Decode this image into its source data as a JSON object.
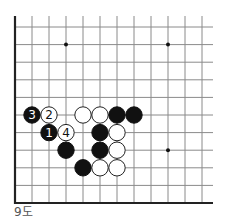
{
  "diagram": {
    "caption": "9도",
    "board": {
      "cols": 12,
      "rows": 11,
      "origin_x": 15,
      "origin_y": 27,
      "spacing_x": 17,
      "spacing_y": 17.6,
      "line_color": "#8a8a8a",
      "edge_color": "#222222",
      "edges": [
        "left",
        "bottom"
      ],
      "star_points": [
        {
          "col": 3,
          "row": 1
        },
        {
          "col": 9,
          "row": 1
        },
        {
          "col": 9,
          "row": 7
        },
        {
          "col": 3,
          "row": 7
        }
      ]
    },
    "stones": [
      {
        "col": 1,
        "row": 5,
        "color": "black",
        "label": "3"
      },
      {
        "col": 2,
        "row": 5,
        "color": "white",
        "label": "2"
      },
      {
        "col": 4,
        "row": 5,
        "color": "white",
        "label": ""
      },
      {
        "col": 5,
        "row": 5,
        "color": "white",
        "label": ""
      },
      {
        "col": 6,
        "row": 5,
        "color": "black",
        "label": ""
      },
      {
        "col": 7,
        "row": 5,
        "color": "black",
        "label": ""
      },
      {
        "col": 2,
        "row": 6,
        "color": "black",
        "label": "1"
      },
      {
        "col": 3,
        "row": 6,
        "color": "white",
        "label": "4"
      },
      {
        "col": 5,
        "row": 6,
        "color": "black",
        "label": ""
      },
      {
        "col": 6,
        "row": 6,
        "color": "white",
        "label": ""
      },
      {
        "col": 3,
        "row": 7,
        "color": "black",
        "label": ""
      },
      {
        "col": 5,
        "row": 7,
        "color": "black",
        "label": ""
      },
      {
        "col": 6,
        "row": 7,
        "color": "white",
        "label": ""
      },
      {
        "col": 4,
        "row": 8,
        "color": "black",
        "label": ""
      },
      {
        "col": 5,
        "row": 8,
        "color": "white",
        "label": ""
      },
      {
        "col": 6,
        "row": 8,
        "color": "white",
        "label": ""
      }
    ]
  }
}
